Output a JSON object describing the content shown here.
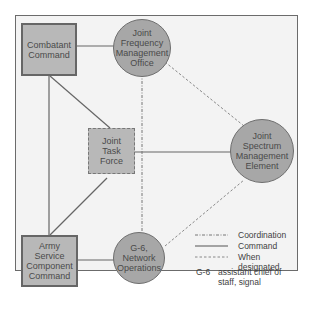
{
  "diagram": {
    "nodes": {
      "combatant_command": "Combatant Command",
      "jfmo": "Joint Frequency Management Office",
      "jtf": "Joint Task Force",
      "jsme": "Joint Spectrum Management Element",
      "ascc": "Army Service Component Command",
      "g6": "G-6, Network Operations"
    },
    "legend": {
      "coordination": "Coordination",
      "command": "Command",
      "when_designated": "When designated",
      "abbr_key": "G-6",
      "abbr_value": "assistant chief of staff, signal"
    },
    "colors": {
      "node_fill": "#b0b0b0",
      "background": "#f3f3f3",
      "line": "#666666"
    }
  }
}
